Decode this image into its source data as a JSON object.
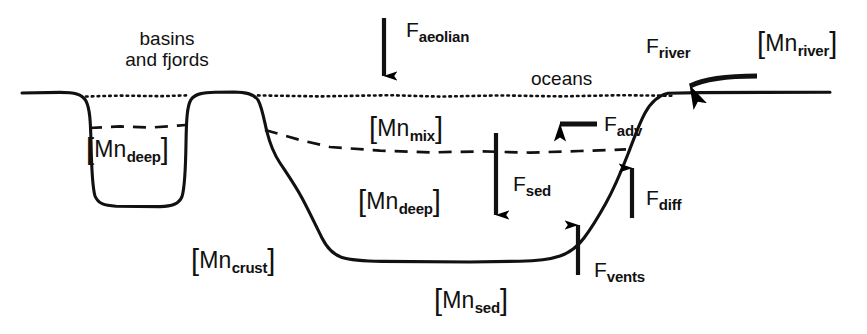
{
  "figure": {
    "type": "schematic-box-model",
    "background_color": "#ffffff",
    "ink_color": "#000000"
  },
  "region_labels": [
    {
      "id": "basins-and-fjords",
      "name": "basins-and-fjords-label",
      "line1": "basins",
      "line2": "and fjords",
      "x": 103,
      "y": 28,
      "width": 128
    },
    {
      "id": "oceans",
      "name": "oceans-label",
      "text": "oceans",
      "x": 531,
      "y": 68
    }
  ],
  "concentration_labels": [
    {
      "id": "mn-deep-basin",
      "name": "mn-deep-basin-label",
      "open": "[",
      "symbol": "Mn",
      "sub": "deep",
      "close": "]",
      "x": 86,
      "y": 131
    },
    {
      "id": "mn-mix",
      "name": "mn-mix-label",
      "open": "[",
      "symbol": "Mn",
      "sub": "mix",
      "close": "]",
      "x": 369,
      "y": 110
    },
    {
      "id": "mn-deep-ocean",
      "name": "mn-deep-ocean-label",
      "open": "[",
      "symbol": "Mn",
      "sub": "deep",
      "close": "]",
      "x": 358,
      "y": 183
    },
    {
      "id": "mn-crust",
      "name": "mn-crust-label",
      "open": "[",
      "symbol": "Mn",
      "sub": "crust",
      "close": "]",
      "x": 191,
      "y": 242
    },
    {
      "id": "mn-sed",
      "name": "mn-sed-label",
      "open": "[",
      "symbol": "Mn",
      "sub": "sed",
      "close": "]",
      "x": 434,
      "y": 282
    },
    {
      "id": "mn-river",
      "name": "mn-river-label",
      "open": "[",
      "symbol": "Mn",
      "sub": "river",
      "close": "]",
      "x": 757,
      "y": 25
    }
  ],
  "flux_labels": [
    {
      "id": "f-aeolian",
      "name": "f-aeolian-label",
      "symbol": "F",
      "sub": "aeolian",
      "x": 406,
      "y": 18,
      "direction": "down",
      "description": "aeolian (atmospheric dust) input to surface ocean"
    },
    {
      "id": "f-river",
      "name": "f-river-label",
      "symbol": "F",
      "sub": "river",
      "x": 646,
      "y": 34,
      "direction": "left",
      "description": "riverine input to the ocean"
    },
    {
      "id": "f-adv",
      "name": "f-adv-label",
      "symbol": "F",
      "sub": "adv",
      "x": 604,
      "y": 112,
      "direction": "left",
      "description": "advective transport in the mixed layer"
    },
    {
      "id": "f-sed",
      "name": "f-sed-label",
      "symbol": "F",
      "sub": "sed",
      "x": 513,
      "y": 172,
      "direction": "down",
      "description": "sedimentation flux to the seafloor"
    },
    {
      "id": "f-diff",
      "name": "f-diff-label",
      "symbol": "F",
      "sub": "diff",
      "x": 646,
      "y": 186,
      "direction": "up",
      "description": "diffusive flux out of margin sediments"
    },
    {
      "id": "f-vents",
      "name": "f-vents-label",
      "symbol": "F",
      "sub": "vents",
      "x": 594,
      "y": 258,
      "direction": "up",
      "description": "hydrothermal vent input from the seafloor"
    }
  ],
  "arrows": [
    {
      "id": "arrow-aeolian",
      "name": "arrow-aeolian",
      "direction": "down",
      "x1": 384,
      "y1": 18,
      "x2": 384,
      "y2": 88
    },
    {
      "id": "arrow-sed",
      "name": "arrow-sed",
      "direction": "down",
      "x1": 496,
      "y1": 133,
      "x2": 496,
      "y2": 228
    },
    {
      "id": "arrow-adv",
      "name": "arrow-adv",
      "direction": "left",
      "x1": 597,
      "y1": 124,
      "x2": 543,
      "y2": 124
    },
    {
      "id": "arrow-vents",
      "name": "arrow-vents",
      "direction": "up",
      "x1": 578,
      "y1": 275,
      "x2": 578,
      "y2": 211
    },
    {
      "id": "arrow-diff",
      "name": "arrow-diff",
      "direction": "up",
      "x1": 632,
      "y1": 218,
      "x2": 632,
      "y2": 155
    },
    {
      "id": "arrow-river",
      "name": "arrow-river",
      "direction": "left",
      "x1": 757,
      "y1": 75,
      "x2": 672,
      "y2": 92
    }
  ],
  "curves": {
    "sea_surface": {
      "name": "sea-surface-dotted-line",
      "style": "dotted",
      "y": 94
    },
    "mixed_layer_base": {
      "name": "mixed-layer-dashed-line",
      "style": "dashed",
      "y_left": 128,
      "y_right": 150
    },
    "seafloor": {
      "name": "seafloor-solid-line",
      "style": "solid",
      "abyssal_plain_y": 260,
      "basin_floor_y": 206
    }
  }
}
